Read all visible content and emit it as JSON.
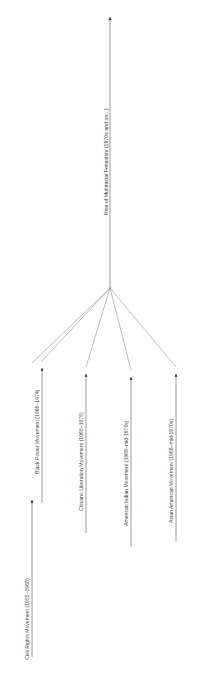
{
  "diagram": {
    "type": "convergence-tree",
    "orientation": "rotated-90-ccw",
    "background_color": "#ffffff",
    "line_color": "#8a8a8a",
    "branch_line_color": "#a8a8a8",
    "text_color": "#3f3f3f",
    "trunk": {
      "id": "trunk",
      "label": "Rise of Multiracial Feminism (1970s and on...)",
      "name": "Rise of Multiracial Feminism",
      "period": "1970s and on...",
      "direction": "up"
    },
    "branches": [
      {
        "id": "civil-rights",
        "label": "Civil Rights Movement (1955–1968)",
        "name": "Civil Rights Movement",
        "period": "1955–1968",
        "start_year": 1955,
        "end_year": 1968,
        "direction": "up"
      },
      {
        "id": "black-power",
        "label": "Black Power Movement (1966–1974)",
        "name": "Black Power Movement",
        "period": "1966–1974",
        "start_year": 1966,
        "end_year": 1974,
        "direction": "up"
      },
      {
        "id": "chicano-liberation",
        "label": "Chicano Liberation Movement (1965–1975)",
        "name": "Chicano Liberation Movement",
        "period": "1965–1975",
        "start_year": 1965,
        "end_year": 1975,
        "direction": "up"
      },
      {
        "id": "american-indian",
        "label": "American Indian Movement (1968–mid-1970s)",
        "name": "American Indian Movement",
        "period": "1968–mid-1970s",
        "start_year": 1968,
        "end_year": 1975,
        "direction": "up"
      },
      {
        "id": "asian-american",
        "label": "Asian American Movement (1968–mid-1970s)",
        "name": "Asian American Movement",
        "period": "1968–mid-1970s",
        "start_year": 1968,
        "end_year": 1975,
        "direction": "up"
      }
    ]
  }
}
